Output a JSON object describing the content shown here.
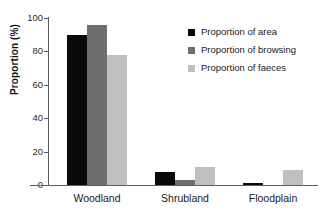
{
  "chart_data": {
    "type": "bar",
    "title": "",
    "subtitle": "",
    "xlabel": "",
    "ylabel": "Proportion (%)",
    "ylim": [
      0,
      100
    ],
    "yticks": [
      0,
      20,
      40,
      60,
      80,
      100
    ],
    "ytick_labels": [
      "0",
      "20",
      "40",
      "60",
      "80",
      "100"
    ],
    "grid": false,
    "legend_position": "top-right",
    "categories": [
      "Woodland",
      "Shrubland",
      "Floodplain"
    ],
    "series": [
      {
        "name": "Proportion of area",
        "color": "#0a0a0a",
        "values": [
          90,
          7.5,
          1.5
        ]
      },
      {
        "name": "Proportion of browsing",
        "color": "#6e6e6e",
        "values": [
          96,
          3,
          0
        ]
      },
      {
        "name": "Proportion of faeces",
        "color": "#bfbfbf",
        "values": [
          78,
          11,
          9
        ]
      }
    ]
  },
  "axes": {
    "y_title": "Proportion (%)",
    "y_tick_labels": [
      "100",
      "80",
      "60",
      "40",
      "20",
      "0"
    ],
    "x_tick_labels": [
      "Woodland",
      "Shrubland",
      "Floodplain"
    ]
  },
  "legend": {
    "items": [
      {
        "label": "Proportion of area",
        "color": "#0a0a0a",
        "swatch": "square-swatch"
      },
      {
        "label": "Proportion of browsing",
        "color": "#6e6e6e",
        "swatch": "square-swatch"
      },
      {
        "label": "Proportion of faeces",
        "color": "#bfbfbf",
        "swatch": "square-swatch"
      }
    ]
  }
}
